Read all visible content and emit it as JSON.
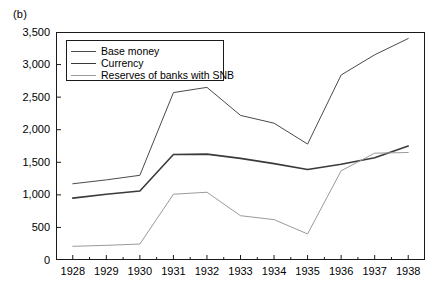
{
  "panel": {
    "label": "(b)"
  },
  "colors": {
    "base_money": "#4a4a4a",
    "currency": "#3a3a3a",
    "reserves": "#9a9a9a",
    "axis": "#1a1a1a",
    "background": "#ffffff"
  },
  "legend": {
    "position": "top-left-inside",
    "entries": [
      {
        "label": "Base money",
        "color": "#4a4a4a",
        "width": 1.0
      },
      {
        "label": "Currency",
        "color": "#3a3a3a",
        "width": 1.6
      },
      {
        "label": "Reserves of banks with SNB",
        "color": "#9a9a9a",
        "width": 1.0
      }
    ]
  },
  "chart_data": {
    "type": "line",
    "title": "(b)",
    "xlabel": "",
    "ylabel": "",
    "grid": false,
    "xlim": [
      1927.5,
      1938.5
    ],
    "ylim": [
      0,
      3500
    ],
    "yticks": [
      0,
      500,
      1000,
      1500,
      2000,
      2500,
      3000,
      3500
    ],
    "ytick_labels": [
      "0",
      "500",
      "1,000",
      "1,500",
      "2,000",
      "2,500",
      "3,000",
      "3,500"
    ],
    "x": [
      1928,
      1929,
      1930,
      1931,
      1932,
      1933,
      1934,
      1935,
      1936,
      1937,
      1938
    ],
    "xtick_labels": [
      "1928",
      "1929",
      "1930",
      "1931",
      "1932",
      "1933",
      "1934",
      "1935",
      "1936",
      "1937",
      "1938"
    ],
    "series": [
      {
        "name": "Base money",
        "color": "#4a4a4a",
        "values": [
          1170,
          1230,
          1300,
          2570,
          2650,
          2220,
          2100,
          1780,
          2840,
          3150,
          3400
        ]
      },
      {
        "name": "Currency",
        "color": "#3a3a3a",
        "values": [
          950,
          1010,
          1060,
          1620,
          1625,
          1560,
          1480,
          1390,
          1470,
          1570,
          1750
        ]
      },
      {
        "name": "Reserves of banks with SNB",
        "color": "#9a9a9a",
        "values": [
          210,
          225,
          245,
          1010,
          1040,
          680,
          620,
          400,
          1370,
          1640,
          1650
        ]
      }
    ]
  }
}
